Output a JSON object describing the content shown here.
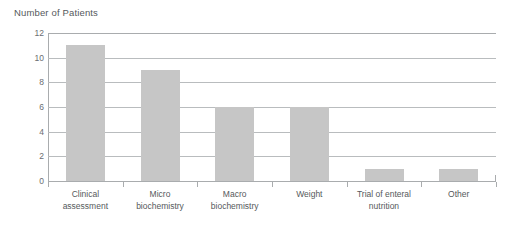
{
  "chart_data": {
    "type": "bar",
    "title": "Number of Patients",
    "xlabel": "",
    "ylabel": "",
    "ylim": [
      0,
      12
    ],
    "ytick_step": 2,
    "yticks": [
      "0",
      "2",
      "4",
      "6",
      "8",
      "10",
      "12"
    ],
    "grid": true,
    "legend": "none",
    "bar_color": "#c6c6c6",
    "grid_color": "#b9bcbe",
    "axis_color": "#a9acae",
    "text_color": "#55595c",
    "categories": [
      "Clinical\nassessment",
      "Micro\nbiochemistry",
      "Macro\nbiochemistry",
      "Weight",
      "Trial of enteral\nnutrition",
      "Other"
    ],
    "values": [
      11,
      9,
      6,
      6,
      1,
      1
    ]
  }
}
